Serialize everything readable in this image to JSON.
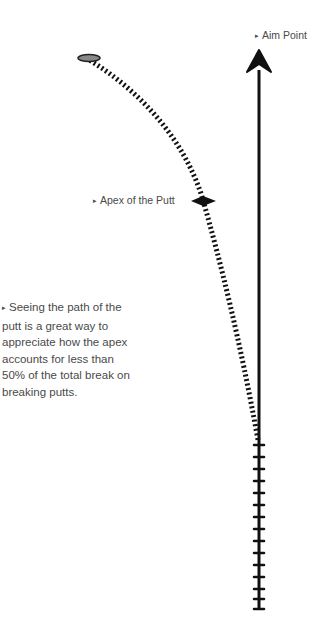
{
  "labels": {
    "aim_point": "Aim Point",
    "apex": "Apex of the Putt",
    "note": "Seeing the path of the putt is a great way to appreciate how the apex accounts for less than 50% of the total break on breaking putts."
  },
  "marker_glyph": "▸",
  "colors": {
    "line": "#111111",
    "text": "#4a4a4a",
    "background": "#ffffff"
  },
  "icons": {
    "aim_arrow": "arrow-up-icon",
    "ball": "golf-ball-icon",
    "apex_marker": "apex-diamond-icon"
  }
}
